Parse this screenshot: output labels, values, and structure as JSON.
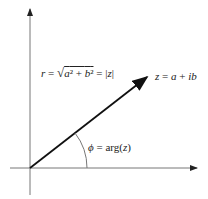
{
  "diagram": {
    "axes": {
      "origin": [
        30,
        168
      ],
      "x_end": 198,
      "y_end": 8
    },
    "vector": {
      "from": [
        30,
        168
      ],
      "to": [
        147,
        77
      ],
      "color": "#1a1a1a"
    },
    "labels": {
      "modulus_lhs": "r = ",
      "modulus_radicand": "a² + b²",
      "modulus_rhs": " = |z|",
      "point": "z = a + ib",
      "angle": "ϕ = arg(z)"
    },
    "angle_arc": {
      "radius": 57
    }
  }
}
